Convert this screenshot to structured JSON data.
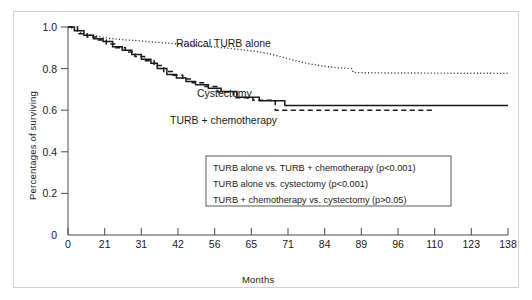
{
  "chart_data": {
    "type": "line",
    "subtype": "kaplan-meier-step",
    "title": "",
    "xlabel": "Months",
    "ylabel": "Percentages of surviving",
    "xtick_labels": [
      "0",
      "21",
      "31",
      "42",
      "56",
      "65",
      "71",
      "84",
      "89",
      "96",
      "110",
      "123",
      "138"
    ],
    "xtick_spacing": "even",
    "ytick_labels": [
      "0",
      "0.2",
      "0.4",
      "0.6",
      "0.8",
      "1.0"
    ],
    "ytick_values": [
      0,
      0.2,
      0.4,
      0.6,
      0.8,
      1.0
    ],
    "ylim": [
      0,
      1.0
    ],
    "grid": false,
    "legend_position": "inside-lower-right",
    "series": [
      {
        "name": "Radical TURB alone",
        "line_style": "dotted",
        "color": "#3a3a3a",
        "label_text": "Radical TURB alone",
        "points": [
          [
            0,
            1.0
          ],
          [
            1.2,
            0.995
          ],
          [
            2.4,
            0.985
          ],
          [
            3.6,
            0.975
          ],
          [
            5.0,
            0.968
          ],
          [
            7.0,
            0.962
          ],
          [
            9.5,
            0.955
          ],
          [
            12.0,
            0.948
          ],
          [
            15.0,
            0.942
          ],
          [
            18.0,
            0.938
          ],
          [
            21.0,
            0.935
          ],
          [
            25.0,
            0.93
          ],
          [
            30.0,
            0.924
          ],
          [
            35.0,
            0.918
          ],
          [
            40.0,
            0.912
          ],
          [
            45.0,
            0.905
          ],
          [
            50.0,
            0.898
          ],
          [
            55.0,
            0.89
          ],
          [
            60.0,
            0.88
          ],
          [
            64.0,
            0.868
          ],
          [
            68.0,
            0.852
          ],
          [
            72.0,
            0.836
          ],
          [
            76.0,
            0.822
          ],
          [
            80.0,
            0.812
          ],
          [
            84.0,
            0.805
          ],
          [
            89.0,
            0.8
          ],
          [
            89.5,
            0.781
          ],
          [
            100.0,
            0.779
          ],
          [
            120.0,
            0.778
          ],
          [
            138.0,
            0.777
          ]
        ]
      },
      {
        "name": "Cystectomy",
        "line_style": "solid",
        "color": "#1a1a1a",
        "label_text": "Cystectomy",
        "points": [
          [
            0,
            1.0
          ],
          [
            2,
            1.0
          ],
          [
            2,
            0.982
          ],
          [
            5,
            0.982
          ],
          [
            5,
            0.96
          ],
          [
            8,
            0.96
          ],
          [
            8,
            0.944
          ],
          [
            11,
            0.944
          ],
          [
            11,
            0.93
          ],
          [
            14,
            0.93
          ],
          [
            14,
            0.905
          ],
          [
            17,
            0.905
          ],
          [
            17,
            0.888
          ],
          [
            20,
            0.888
          ],
          [
            20,
            0.868
          ],
          [
            23,
            0.868
          ],
          [
            23,
            0.845
          ],
          [
            26,
            0.845
          ],
          [
            26,
            0.826
          ],
          [
            28,
            0.826
          ],
          [
            28,
            0.8
          ],
          [
            31,
            0.8
          ],
          [
            31,
            0.772
          ],
          [
            34,
            0.772
          ],
          [
            34,
            0.755
          ],
          [
            37,
            0.755
          ],
          [
            37,
            0.738
          ],
          [
            40,
            0.738
          ],
          [
            40,
            0.722
          ],
          [
            44,
            0.722
          ],
          [
            44,
            0.706
          ],
          [
            48,
            0.706
          ],
          [
            48,
            0.69
          ],
          [
            53,
            0.69
          ],
          [
            53,
            0.662
          ],
          [
            60,
            0.662
          ],
          [
            60,
            0.645
          ],
          [
            68,
            0.645
          ],
          [
            68,
            0.622
          ],
          [
            138,
            0.622
          ]
        ]
      },
      {
        "name": "TURB + chemotherapy",
        "line_style": "dashed",
        "color": "#1a1a1a",
        "label_text": "TURB + chemotherapy",
        "points": [
          [
            0,
            1.0
          ],
          [
            3,
            1.0
          ],
          [
            3,
            0.968
          ],
          [
            6,
            0.968
          ],
          [
            6,
            0.952
          ],
          [
            9,
            0.952
          ],
          [
            9,
            0.938
          ],
          [
            12,
            0.938
          ],
          [
            12,
            0.918
          ],
          [
            15,
            0.918
          ],
          [
            15,
            0.9
          ],
          [
            18,
            0.9
          ],
          [
            18,
            0.88
          ],
          [
            21,
            0.88
          ],
          [
            21,
            0.858
          ],
          [
            24,
            0.858
          ],
          [
            24,
            0.838
          ],
          [
            27,
            0.838
          ],
          [
            27,
            0.815
          ],
          [
            30,
            0.815
          ],
          [
            30,
            0.786
          ],
          [
            33,
            0.786
          ],
          [
            33,
            0.768
          ],
          [
            36,
            0.768
          ],
          [
            36,
            0.75
          ],
          [
            39,
            0.75
          ],
          [
            39,
            0.732
          ],
          [
            43,
            0.732
          ],
          [
            43,
            0.714
          ],
          [
            47,
            0.714
          ],
          [
            47,
            0.688
          ],
          [
            52,
            0.688
          ],
          [
            52,
            0.66
          ],
          [
            58,
            0.66
          ],
          [
            58,
            0.648
          ],
          [
            65,
            0.648
          ],
          [
            65,
            0.6
          ],
          [
            115,
            0.6
          ]
        ]
      }
    ],
    "annotations": [
      {
        "name": "radical-turb-label",
        "text": "Radical TURB alone",
        "x_px": 176,
        "y_px": 46
      },
      {
        "name": "cystectomy-label",
        "text": "Cystectomy",
        "x_px": 197,
        "y_px": 96
      },
      {
        "name": "turb-chemo-label",
        "text": "TURB + chemotherapy",
        "x_px": 170,
        "y_px": 123
      }
    ],
    "legend_box": {
      "lines": [
        "TURB alone vs. TURB + chemotherapy (p<0.001)",
        "TURB alone vs. cystectomy (p<0.001)",
        "TURB + chemotherapy vs. cystectomy (p>0.05)"
      ]
    }
  }
}
